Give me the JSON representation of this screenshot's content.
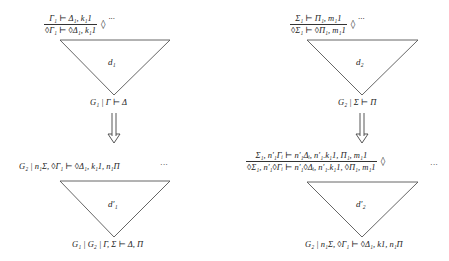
{
  "diagram": {
    "top_left": {
      "premise_numerator": "Γ₁ ⊢ Δ₁, k₁1",
      "premise_denominator": "◊Γ₁ ⊢ ◊Δ₁, k₁1",
      "rule": "◊",
      "ellipsis": "···",
      "derivation_label": "d₁",
      "conclusion": "G₁ | Γ ⊢ Δ"
    },
    "top_right": {
      "premise_numerator": "Σ₁ ⊢ Π₁, m₁1",
      "premise_denominator": "◊Σ₁ ⊢ ◊Π₁, m₁1",
      "rule": "◊",
      "ellipsis": "···",
      "derivation_label": "d₂",
      "conclusion": "G₂ | Σ ⊢ Π"
    },
    "arrows": {
      "left": "⇓",
      "right": "⇓"
    },
    "bottom_left": {
      "top_sequent": "G₂ | n₁Σ, ◊Γ₁ ⊢ ◊Δ₁, k₁1, n₁Π",
      "ellipsis": "···",
      "derivation_label": "d′₁",
      "conclusion": "G₁ | G₂ | Γ, Σ ⊢ Δ, Π"
    },
    "bottom_right": {
      "premise_numerator": "Σ₁, n′₁Γᵢ ⊢ n′₁Δᵢ, n′₁.k₁1, Π₁, m₁1",
      "premise_denominator": "◊Σ₁, n′₁◊Γᵢ ⊢ n′₁◊Δᵢ, n′₁.k₁1, ◊Π₁, m₁1",
      "rule": "◊",
      "ellipsis": "···",
      "derivation_label": "d′₂",
      "conclusion": "G₂ | n₁Σ, ◊Γ₁ ⊢ ◊Δ₁, k1, n₁Π"
    },
    "colors": {
      "stroke": "#555555",
      "text": "#222222",
      "background": "#ffffff"
    }
  }
}
